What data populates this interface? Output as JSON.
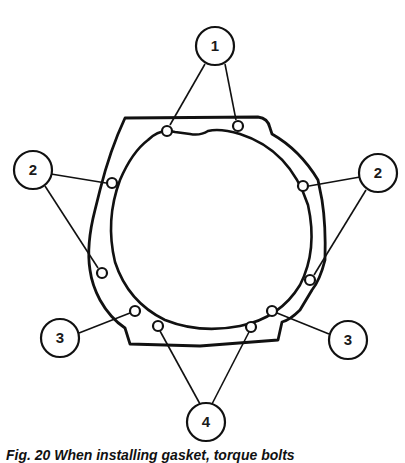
{
  "diagram": {
    "callouts": [
      {
        "id": "1",
        "label": "1",
        "cx": 215,
        "cy": 46
      },
      {
        "id": "2-left",
        "label": "2",
        "cx": 33,
        "cy": 170
      },
      {
        "id": "2-right",
        "label": "2",
        "cx": 378,
        "cy": 173
      },
      {
        "id": "3-left",
        "label": "3",
        "cx": 60,
        "cy": 338
      },
      {
        "id": "3-right",
        "label": "3",
        "cx": 348,
        "cy": 340
      },
      {
        "id": "4",
        "label": "4",
        "cx": 206,
        "cy": 422
      }
    ],
    "caption": "Fig. 20  When installing gasket, torque bolts"
  }
}
